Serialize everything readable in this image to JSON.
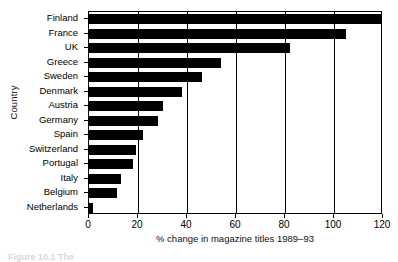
{
  "chart_data": {
    "type": "bar",
    "orientation": "horizontal",
    "title": "",
    "xlabel": "% change in magazine titles 1989–93",
    "ylabel": "Country",
    "xlim": [
      0,
      120
    ],
    "xticks": [
      0,
      20,
      40,
      60,
      80,
      100,
      120
    ],
    "xtick_labels": [
      "0",
      "20",
      "40",
      "60",
      "80",
      "100",
      "120"
    ],
    "grid": "vertical",
    "legend": "none",
    "bar_color": "#000000",
    "categories": [
      "Finland",
      "France",
      "UK",
      "Greece",
      "Sweden",
      "Denmark",
      "Austria",
      "Germany",
      "Spain",
      "Switzerland",
      "Portugal",
      "Italy",
      "Belgium",
      "Netherlands"
    ],
    "values": [
      119,
      105,
      82,
      54,
      46,
      38,
      30,
      28,
      22,
      19,
      18,
      13,
      11.5,
      1.5
    ]
  },
  "caption": {
    "bottom_cut_text": "Figure 10.1   The"
  }
}
